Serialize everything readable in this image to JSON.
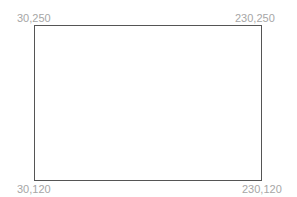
{
  "diagram": {
    "shape": "rectangle",
    "stroke_color": "#555555",
    "label_color": "#a6a6a6",
    "corners": {
      "top_left": "30,250",
      "top_right": "230,250",
      "bottom_left": "30,120",
      "bottom_right": "230,120"
    }
  }
}
